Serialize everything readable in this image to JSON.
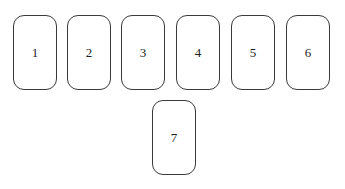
{
  "diagram": {
    "top_row": [
      {
        "label": "1"
      },
      {
        "label": "2"
      },
      {
        "label": "3"
      },
      {
        "label": "4"
      },
      {
        "label": "5"
      },
      {
        "label": "6"
      }
    ],
    "bottom_row": [
      {
        "label": "7"
      }
    ]
  },
  "colors": {
    "card_border": "#3a3a3a",
    "text": "#1e1e1e",
    "background": "#ffffff"
  }
}
